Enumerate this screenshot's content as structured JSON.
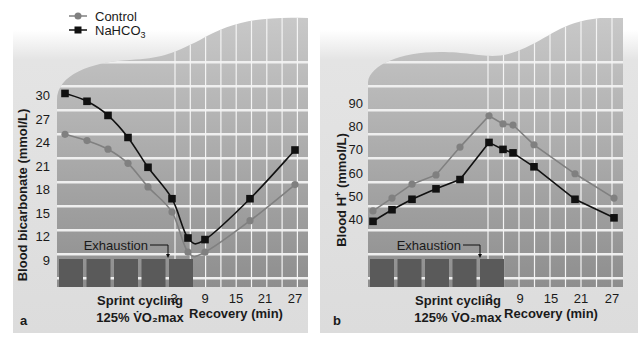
{
  "legend": {
    "items": [
      {
        "label": "Control",
        "marker": "circle",
        "color": "#808080"
      },
      {
        "label": "NaHCO₃",
        "marker": "square",
        "color": "#111111"
      }
    ]
  },
  "panels": [
    {
      "letter": "a",
      "ylabel": "Blood bicarbonate  (mmol/L)",
      "exhaustion_label": "Exhaustion",
      "sprint_label_1": "Sprint cycling",
      "sprint_label_2": "125% V̇O₂max",
      "recovery_label": "Recovery (min)",
      "yticks": [
        "30",
        "27",
        "24",
        "21",
        "18",
        "15",
        "12",
        "9"
      ],
      "xticks": [
        "3",
        "9",
        "15",
        "21",
        "27"
      ]
    },
    {
      "letter": "b",
      "ylabel": "Blood H⁺ (mmol/L)",
      "exhaustion_label": "Exhaustion",
      "sprint_label_1": "Sprint cycling",
      "sprint_label_2": "125% V̇O₂max",
      "recovery_label": "Recovery (min)",
      "yticks": [
        "90",
        "80",
        "70",
        "60",
        "50",
        "40"
      ],
      "xticks": [
        "3",
        "9",
        "15",
        "21",
        "27"
      ]
    }
  ],
  "chart_data": [
    {
      "type": "line",
      "title": "a",
      "xlabel": "Sprint cycling 125% VO2max / Recovery (min)",
      "ylabel": "Blood bicarbonate (mmol/L)",
      "ylim": [
        9,
        30
      ],
      "yticks": [
        9,
        12,
        15,
        18,
        21,
        24,
        27,
        30
      ],
      "x": [
        "sprint1",
        "sprint2",
        "sprint3",
        "sprint4",
        "sprint5",
        "exhaustion",
        "rec3",
        "rec9",
        "rec21",
        "rec27"
      ],
      "recovery_ticks": [
        3,
        9,
        15,
        21,
        27
      ],
      "grid": true,
      "legend_position": "top-left",
      "series": [
        {
          "name": "Control",
          "values": [
            25.0,
            24.2,
            23.1,
            21.3,
            18.3,
            15.1,
            10.0,
            10.0,
            14.0,
            18.6
          ]
        },
        {
          "name": "NaHCO3",
          "values": [
            30.2,
            29.2,
            27.4,
            24.6,
            20.8,
            16.8,
            11.8,
            11.6,
            16.8,
            23.0
          ]
        }
      ],
      "annotations": [
        "Exhaustion"
      ]
    },
    {
      "type": "line",
      "title": "b",
      "xlabel": "Sprint cycling 125% VO2max / Recovery (min)",
      "ylabel": "Blood H+ (mmol/L)",
      "ylim": [
        40,
        90
      ],
      "yticks": [
        40,
        50,
        60,
        70,
        80,
        90
      ],
      "x": [
        "sprint1",
        "sprint2",
        "sprint3",
        "sprint4",
        "sprint5",
        "exhaustion",
        "rec3",
        "rec6",
        "rec12",
        "rec21",
        "rec27"
      ],
      "recovery_ticks": [
        3,
        9,
        15,
        21,
        27
      ],
      "grid": true,
      "series": [
        {
          "name": "Control",
          "values": [
            43.5,
            49,
            55,
            59,
            71,
            84.5,
            81,
            80.5,
            72,
            59.5,
            49
          ]
        },
        {
          "name": "NaHCO3",
          "values": [
            39,
            44,
            48.5,
            53,
            57,
            73,
            70,
            68.5,
            62.5,
            48.5,
            40.5
          ]
        }
      ],
      "annotations": [
        "Exhaustion"
      ]
    }
  ]
}
